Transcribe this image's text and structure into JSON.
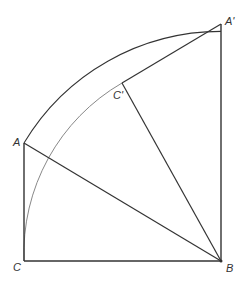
{
  "diagram": {
    "points": {
      "A": {
        "label": "A",
        "x": 24,
        "y": 143
      },
      "B": {
        "label": "B",
        "x": 221,
        "y": 261
      },
      "C": {
        "label": "C",
        "x": 24,
        "y": 261
      },
      "A_prime": {
        "label": "A'",
        "x": 221,
        "y": 24
      },
      "C_prime": {
        "label": "C'",
        "x": 122,
        "y": 83
      }
    },
    "segments": [
      {
        "from": "A",
        "to": "C"
      },
      {
        "from": "C",
        "to": "B"
      },
      {
        "from": "A",
        "to": "B"
      },
      {
        "from": "B",
        "to": "A_prime"
      },
      {
        "from": "A_prime",
        "to": "C_prime"
      },
      {
        "from": "C_prime",
        "to": "B"
      }
    ],
    "arcs": [
      {
        "name": "arc-A-to-A-prime",
        "center": "B",
        "from": "A",
        "to": "A_prime"
      },
      {
        "name": "arc-C-to-C-prime",
        "center": "B",
        "from": "C",
        "to": "C_prime"
      }
    ],
    "colors": {
      "line": "#333333",
      "inner_arc": "#888888",
      "background": "#ffffff"
    }
  }
}
